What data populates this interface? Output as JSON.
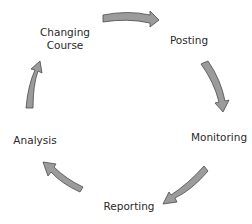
{
  "diagram": {
    "type": "cycle",
    "colors": {
      "arrow_fill": "#9b9b9b",
      "arrow_stroke": "#4a4a4a",
      "text": "#2a2a2a",
      "background": "#ffffff"
    },
    "stages": [
      {
        "id": "changing-course",
        "line1": "Changing",
        "line2": "Course"
      },
      {
        "id": "posting",
        "label": "Posting"
      },
      {
        "id": "monitoring",
        "label": "Monitoring"
      },
      {
        "id": "reporting",
        "label": "Reporting"
      },
      {
        "id": "analysis",
        "label": "Analysis"
      }
    ],
    "arrows": [
      {
        "from": "changing-course",
        "to": "posting",
        "direction": "right"
      },
      {
        "from": "posting",
        "to": "monitoring",
        "direction": "down"
      },
      {
        "from": "monitoring",
        "to": "reporting",
        "direction": "down-left"
      },
      {
        "from": "reporting",
        "to": "analysis",
        "direction": "up-left"
      },
      {
        "from": "analysis",
        "to": "changing-course",
        "direction": "up"
      }
    ]
  }
}
